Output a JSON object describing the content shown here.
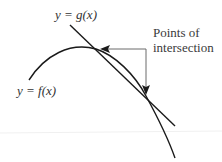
{
  "diagram": {
    "labels": {
      "g_curve": "y = g(x)",
      "f_curve": "y = f(x)",
      "annotation_line1": "Points of",
      "annotation_line2": "intersection"
    },
    "curves": [
      {
        "name": "g",
        "type": "straight-line",
        "label": "y = g(x)"
      },
      {
        "name": "f",
        "type": "concave-down-curve",
        "label": "y = f(x)"
      }
    ],
    "intersections_count": 2,
    "colors": {
      "stroke": "#1a1a1a",
      "arrow": "#555555",
      "text": "#333333",
      "background": "#ffffff"
    }
  }
}
